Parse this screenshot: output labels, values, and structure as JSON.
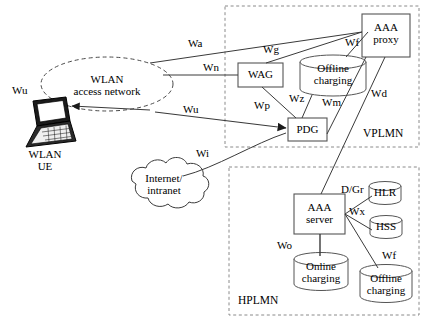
{
  "diagram": {
    "colors": {
      "line": "#3a3a3a",
      "node_stroke": "#555555",
      "dashed_zone": "#777777",
      "text": "#000000",
      "background": "#ffffff"
    },
    "zones": [
      {
        "id": "vplmn",
        "label": "VPLMN"
      },
      {
        "id": "hplmn",
        "label": "HPLMN"
      }
    ],
    "nodes": [
      {
        "id": "wlan-ue",
        "shape": "laptop",
        "label_line1": "WLAN",
        "label_line2": "UE"
      },
      {
        "id": "wlan-access-network",
        "shape": "dashed-ellipse",
        "label_line1": "WLAN",
        "label_line2": "access network"
      },
      {
        "id": "internet-intranet",
        "shape": "cloud",
        "label_line1": "Internet/",
        "label_line2": "intranet"
      },
      {
        "id": "wag",
        "shape": "box",
        "label_line1": "WAG",
        "label_line2": ""
      },
      {
        "id": "pdg",
        "shape": "box",
        "label_line1": "PDG",
        "label_line2": ""
      },
      {
        "id": "aaa-proxy",
        "shape": "box",
        "label_line1": "AAA",
        "label_line2": "proxy"
      },
      {
        "id": "offline-charging-vplmn",
        "shape": "cylinder",
        "label_line1": "Offline",
        "label_line2": "charging"
      },
      {
        "id": "aaa-server",
        "shape": "box",
        "label_line1": "AAA",
        "label_line2": "server"
      },
      {
        "id": "hlr",
        "shape": "cylinder",
        "label_line1": "HLR",
        "label_line2": ""
      },
      {
        "id": "hss",
        "shape": "cylinder",
        "label_line1": "HSS",
        "label_line2": ""
      },
      {
        "id": "online-charging-hplmn",
        "shape": "cylinder",
        "label_line1": "Online",
        "label_line2": "charging"
      },
      {
        "id": "offline-charging-hplmn",
        "shape": "cylinder",
        "label_line1": "Offline",
        "label_line2": "charging"
      }
    ],
    "interfaces": [
      {
        "id": "wu-left",
        "label": "Wu"
      },
      {
        "id": "wa",
        "label": "Wa"
      },
      {
        "id": "wg",
        "label": "Wg"
      },
      {
        "id": "wn",
        "label": "Wn"
      },
      {
        "id": "wf-vplmn",
        "label": "Wf"
      },
      {
        "id": "wu-mid",
        "label": "Wu"
      },
      {
        "id": "wp",
        "label": "Wp"
      },
      {
        "id": "wz",
        "label": "Wz"
      },
      {
        "id": "wm",
        "label": "Wm"
      },
      {
        "id": "wd",
        "label": "Wd"
      },
      {
        "id": "wi",
        "label": "Wi"
      },
      {
        "id": "d-gr",
        "label": "D/Gr"
      },
      {
        "id": "wx",
        "label": "Wx"
      },
      {
        "id": "wo",
        "label": "Wo"
      },
      {
        "id": "wf-hplmn",
        "label": "Wf"
      }
    ]
  }
}
